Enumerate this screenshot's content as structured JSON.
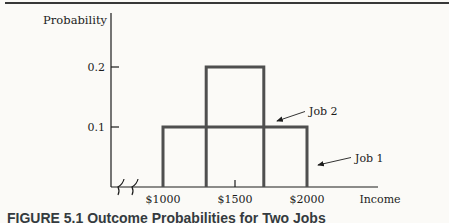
{
  "page": {
    "background": "#fbfaf7"
  },
  "figure": {
    "caption": "FIGURE 5.1 Outcome Probabilities for Two Jobs",
    "top_rule_color": "#383838"
  },
  "chart_data": {
    "type": "area",
    "subtype": "uniform-probability-distributions",
    "title": "",
    "xlabel": "Income",
    "ylabel": "Probability",
    "x_tick_labels": [
      "$1000",
      "$1500",
      "$2000"
    ],
    "x_tick_values": [
      1000,
      1500,
      2000
    ],
    "y_tick_labels": [
      "0.2",
      "0.1"
    ],
    "y_tick_values": [
      0.2,
      0.1
    ],
    "xlim": [
      1000,
      2000
    ],
    "ylim": [
      0,
      0.25
    ],
    "grid": false,
    "x_axis_break": true,
    "stroke_color": "#4f4f4f",
    "series": [
      {
        "name": "Job 1",
        "shape": "uniform",
        "income_range": [
          1000,
          2000
        ],
        "probability": 0.1
      },
      {
        "name": "Job 2",
        "shape": "uniform",
        "income_range": [
          1300,
          1700
        ],
        "probability": 0.2
      }
    ],
    "annotations": [
      {
        "text": "Job 2",
        "points_to": "right-edge-of-job2-distribution"
      },
      {
        "text": "Job 1",
        "points_to": "right-edge-of-job1-distribution"
      }
    ]
  }
}
